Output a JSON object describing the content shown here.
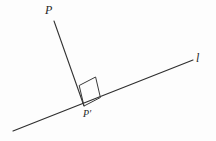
{
  "figure": {
    "kind": "geometry-diagram",
    "background_color": "#fdfdfd",
    "stroke_color": "#2e2e2e",
    "label_color": "#262626",
    "width": 216,
    "height": 141
  },
  "labels": {
    "point_p": "P",
    "point_p_prime": "P′",
    "line_l": "l"
  },
  "geometry": {
    "line_l": {
      "name": "l",
      "x1": 13,
      "y1": 131,
      "x2": 193,
      "y2": 60
    },
    "segment_pp_prime": {
      "name": "PP′",
      "x1": 54,
      "y1": 21,
      "x2": 84,
      "y2": 106
    },
    "right_angle_marker": {
      "points": "84,106 79.2,85.5 95.6,77.0 100.4,97.5"
    }
  }
}
